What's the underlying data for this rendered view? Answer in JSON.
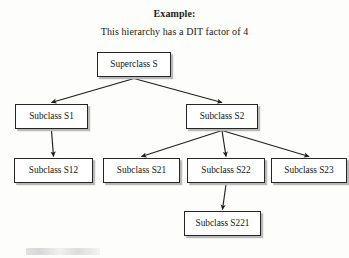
{
  "document": {
    "title": "Example:",
    "subtitle": "This hierarchy has a DIT factor of 4"
  },
  "colors": {
    "page_background": "#fdfdfc",
    "node_fill": "#ffffff",
    "node_border": "#262626",
    "node_shadow": "#b9b9b9",
    "edge": "#1f1f1f",
    "text": "#141414"
  },
  "diagram": {
    "type": "class-hierarchy-tree",
    "dit_factor": 4,
    "nodes": [
      {
        "id": "S",
        "label": "Superclass S",
        "level": 1,
        "x": 97,
        "y": 52,
        "w": 74,
        "h": 25
      },
      {
        "id": "S1",
        "label": "Subclass S1",
        "level": 2,
        "x": 15,
        "y": 104,
        "w": 73,
        "h": 25
      },
      {
        "id": "S2",
        "label": "Subclass S2",
        "level": 2,
        "x": 186,
        "y": 104,
        "w": 72,
        "h": 25
      },
      {
        "id": "S12",
        "label": "Subclass S12",
        "level": 3,
        "x": 14,
        "y": 158,
        "w": 79,
        "h": 25
      },
      {
        "id": "S21",
        "label": "Subclass S21",
        "level": 3,
        "x": 103,
        "y": 158,
        "w": 77,
        "h": 25
      },
      {
        "id": "S22",
        "label": "Subclass S22",
        "level": 3,
        "x": 187,
        "y": 158,
        "w": 78,
        "h": 25
      },
      {
        "id": "S23",
        "label": "Subclass S23",
        "level": 3,
        "x": 271,
        "y": 158,
        "w": 76,
        "h": 25
      },
      {
        "id": "S221",
        "label": "Subclass S221",
        "level": 4,
        "x": 184,
        "y": 211,
        "w": 77,
        "h": 25
      }
    ],
    "edges": [
      {
        "from": "S",
        "to": "S1"
      },
      {
        "from": "S",
        "to": "S2"
      },
      {
        "from": "S1",
        "to": "S12"
      },
      {
        "from": "S2",
        "to": "S21"
      },
      {
        "from": "S2",
        "to": "S22"
      },
      {
        "from": "S2",
        "to": "S23"
      },
      {
        "from": "S22",
        "to": "S221"
      }
    ]
  }
}
